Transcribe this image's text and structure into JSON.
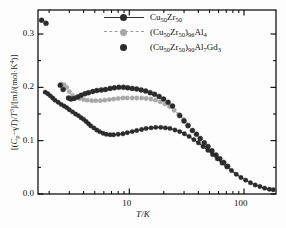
{
  "chart_data": {
    "type": "scatter",
    "title": "",
    "xlabel": "T/K",
    "ylabel": "[(C_p−γT)/T³]/[mJ/(mol·K⁴)]",
    "xscale": "log",
    "yscale": "linear",
    "xlim": [
      1.6,
      190
    ],
    "ylim": [
      0.0,
      0.345
    ],
    "xticks_major": [
      10,
      100
    ],
    "xtick_labels": [
      "10",
      "100"
    ],
    "yticks_major": [
      0.0,
      0.1,
      0.2,
      0.3
    ],
    "ytick_labels": [
      "0.0",
      "0.1",
      "0.2",
      "0.3"
    ],
    "yticks_minor": [
      0.05,
      0.15,
      0.25
    ],
    "grid": false,
    "legend_position": "top-center",
    "series": [
      {
        "name": "Cu50Zr50",
        "label": "Cu₅₀Zr₅₀",
        "color": "#2b2b2b",
        "style": "line-marker",
        "points": [
          [
            1.85,
            0.191
          ],
          [
            1.95,
            0.188
          ],
          [
            2.05,
            0.184
          ],
          [
            2.15,
            0.18
          ],
          [
            2.25,
            0.176
          ],
          [
            2.4,
            0.172
          ],
          [
            2.55,
            0.168
          ],
          [
            2.7,
            0.165
          ],
          [
            2.85,
            0.162
          ],
          [
            3.0,
            0.158
          ],
          [
            3.2,
            0.154
          ],
          [
            3.4,
            0.15
          ],
          [
            3.6,
            0.147
          ],
          [
            3.8,
            0.143
          ],
          [
            4.0,
            0.14
          ],
          [
            4.2,
            0.136
          ],
          [
            4.4,
            0.132
          ],
          [
            4.6,
            0.128
          ],
          [
            4.9,
            0.124
          ],
          [
            5.2,
            0.12
          ],
          [
            5.5,
            0.117
          ],
          [
            5.9,
            0.114
          ],
          [
            6.3,
            0.112
          ],
          [
            6.8,
            0.111
          ],
          [
            7.3,
            0.111
          ],
          [
            8.0,
            0.112
          ],
          [
            8.8,
            0.113
          ],
          [
            9.6,
            0.115
          ],
          [
            10.6,
            0.117
          ],
          [
            11.6,
            0.119
          ],
          [
            12.8,
            0.121
          ],
          [
            14.0,
            0.123
          ],
          [
            15.5,
            0.124
          ],
          [
            17.0,
            0.125
          ],
          [
            18.8,
            0.125
          ],
          [
            20.6,
            0.124
          ],
          [
            22.6,
            0.123
          ],
          [
            25.0,
            0.12
          ],
          [
            27.5,
            0.117
          ],
          [
            30.2,
            0.113
          ],
          [
            33.2,
            0.108
          ],
          [
            36.5,
            0.102
          ],
          [
            40.0,
            0.096
          ],
          [
            44.0,
            0.089
          ],
          [
            48.4,
            0.082
          ],
          [
            53.2,
            0.074
          ],
          [
            58.5,
            0.066
          ],
          [
            64.3,
            0.058
          ],
          [
            70.7,
            0.051
          ],
          [
            77.8,
            0.044
          ],
          [
            85.5,
            0.037
          ],
          [
            94.0,
            0.031
          ],
          [
            103.4,
            0.026
          ],
          [
            113.7,
            0.021
          ],
          [
            125.1,
            0.017
          ],
          [
            137.6,
            0.014
          ],
          [
            151.4,
            0.011
          ],
          [
            166.5,
            0.009
          ],
          [
            180.0,
            0.008
          ]
        ]
      },
      {
        "name": "(Cu50Zr50)96Al4",
        "label": "(Cu₅₀Zr₅₀)₉₆Al₄",
        "color": "#a8a8a8",
        "style": "dashed-marker",
        "points": [
          [
            2.55,
            0.206
          ],
          [
            2.7,
            0.205
          ],
          [
            2.85,
            0.2
          ],
          [
            3.0,
            0.192
          ],
          [
            3.2,
            0.185
          ],
          [
            3.45,
            0.181
          ],
          [
            3.7,
            0.179
          ],
          [
            4.0,
            0.177
          ],
          [
            4.3,
            0.176
          ],
          [
            4.7,
            0.175
          ],
          [
            5.1,
            0.175
          ],
          [
            5.6,
            0.175
          ],
          [
            6.1,
            0.176
          ],
          [
            6.7,
            0.177
          ],
          [
            7.3,
            0.178
          ],
          [
            8.0,
            0.179
          ],
          [
            8.8,
            0.18
          ],
          [
            9.6,
            0.18
          ],
          [
            10.6,
            0.18
          ],
          [
            11.6,
            0.18
          ],
          [
            12.8,
            0.18
          ],
          [
            14.0,
            0.179
          ],
          [
            15.4,
            0.178
          ],
          [
            16.9,
            0.176
          ],
          [
            18.6,
            0.173
          ],
          [
            20.4,
            0.169
          ],
          [
            22.4,
            0.164
          ],
          [
            24.6,
            0.157
          ],
          [
            27.0,
            0.149
          ],
          [
            29.7,
            0.14
          ],
          [
            32.6,
            0.13
          ]
        ]
      },
      {
        "name": "(Cu50Zr50)90Al7Gd3",
        "label": "(Cu₅₀Zr₅₀)₉₀Al₇Gd₃",
        "color": "#2b2b2b",
        "style": "marker-only",
        "points": [
          [
            1.72,
            0.326
          ],
          [
            1.88,
            0.32
          ],
          [
            2.5,
            0.204
          ],
          [
            2.65,
            0.196
          ],
          [
            2.95,
            0.18
          ],
          [
            3.1,
            0.178
          ],
          [
            3.3,
            0.179
          ],
          [
            3.55,
            0.182
          ],
          [
            3.8,
            0.185
          ],
          [
            4.1,
            0.188
          ],
          [
            4.4,
            0.19
          ],
          [
            4.8,
            0.192
          ],
          [
            5.2,
            0.194
          ],
          [
            5.7,
            0.195
          ],
          [
            6.2,
            0.196
          ],
          [
            6.8,
            0.198
          ],
          [
            7.4,
            0.199
          ],
          [
            8.1,
            0.2
          ],
          [
            8.9,
            0.2
          ],
          [
            9.7,
            0.199
          ],
          [
            10.6,
            0.198
          ],
          [
            11.6,
            0.197
          ],
          [
            12.7,
            0.195
          ],
          [
            13.9,
            0.193
          ],
          [
            15.2,
            0.19
          ],
          [
            16.6,
            0.187
          ],
          [
            18.2,
            0.183
          ],
          [
            19.9,
            0.178
          ],
          [
            21.8,
            0.172
          ],
          [
            23.8,
            0.165
          ],
          [
            27.5,
            0.147
          ],
          [
            30.0,
            0.137
          ],
          [
            32.5,
            0.128
          ],
          [
            35.5,
            0.119
          ],
          [
            38.5,
            0.112
          ],
          [
            41.5,
            0.104
          ],
          [
            45.0,
            0.096
          ],
          [
            48.5,
            0.089
          ],
          [
            52.5,
            0.081
          ],
          [
            57.0,
            0.073
          ],
          [
            61.5,
            0.066
          ],
          [
            66.5,
            0.059
          ],
          [
            72.0,
            0.052
          ]
        ]
      }
    ]
  },
  "legend": {
    "entries": [
      {
        "label": "Cu₅₀Zr₅₀"
      },
      {
        "label": "(Cu₅₀Zr₅₀)₉₆Al₄"
      },
      {
        "label": "(Cu₅₀Zr₅₀)₉₀Al₇Gd₃"
      }
    ]
  },
  "axes": {
    "xlabel": "T/K",
    "ylabel": "[(Cₚ−γT)/T³]/[mJ/(mol·K⁴)]",
    "xtick_labels": [
      "10",
      "100"
    ],
    "ytick_labels": [
      "0.0",
      "0.1",
      "0.2",
      "0.3"
    ]
  },
  "colors": {
    "dark": "#2b2b2b",
    "gray": "#a8a8a8",
    "frame": "#000000",
    "background": "#fdfdfd"
  }
}
